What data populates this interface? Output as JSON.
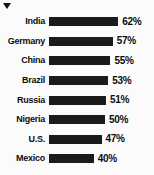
{
  "marker": {
    "icon": "triangle-down-icon"
  },
  "chart_data": {
    "type": "bar",
    "orientation": "horizontal",
    "title": "",
    "subtitle": "",
    "xlabel": "",
    "ylabel": "",
    "xlim": [
      0,
      68
    ],
    "grid": false,
    "legend": false,
    "value_suffix": "%",
    "bar_color": "#1b1b1b",
    "background_color": "#fbfbfb",
    "text_color": "#0d0d0d",
    "categories": [
      "India",
      "Germany",
      "China",
      "Brazil",
      "Russia",
      "Nigeria",
      "U.S.",
      "Mexico"
    ],
    "values": [
      62,
      57,
      55,
      53,
      51,
      50,
      47,
      40
    ],
    "value_labels": [
      "62%",
      "57%",
      "55%",
      "53%",
      "51%",
      "50%",
      "47%",
      "40%"
    ],
    "rows": [
      {
        "label": "India",
        "value": 62,
        "value_label": "62%"
      },
      {
        "label": "Germany",
        "value": 57,
        "value_label": "57%"
      },
      {
        "label": "China",
        "value": 55,
        "value_label": "55%"
      },
      {
        "label": "Brazil",
        "value": 53,
        "value_label": "53%"
      },
      {
        "label": "Russia",
        "value": 51,
        "value_label": "51%"
      },
      {
        "label": "Nigeria",
        "value": 50,
        "value_label": "50%"
      },
      {
        "label": "U.S.",
        "value": 47,
        "value_label": "47%"
      },
      {
        "label": "Mexico",
        "value": 40,
        "value_label": "40%"
      }
    ]
  }
}
